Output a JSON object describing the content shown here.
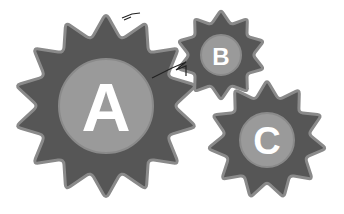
{
  "diagram": {
    "type": "gear-illustration",
    "colors": {
      "background": "#ffffff",
      "gear_body": "#565656",
      "gear_outline": "#8a8a8a",
      "hub": "#9a9a9a",
      "letter": "#ffffff"
    },
    "gears": [
      {
        "id": "A",
        "label": "A",
        "cx": 106,
        "cy": 106,
        "outer_r": 93,
        "inner_r": 68,
        "teeth": 14,
        "hub_r": 47,
        "font_size": 68,
        "rotation": 0
      },
      {
        "id": "B",
        "label": "B",
        "cx": 221,
        "cy": 55,
        "outer_r": 45,
        "inner_r": 32,
        "teeth": 10,
        "hub_r": 20,
        "font_size": 24,
        "rotation": 0
      },
      {
        "id": "C",
        "label": "C",
        "cx": 267,
        "cy": 140,
        "outer_r": 60,
        "inner_r": 42,
        "teeth": 11,
        "hub_r": 27,
        "font_size": 38,
        "rotation": 0
      }
    ]
  }
}
